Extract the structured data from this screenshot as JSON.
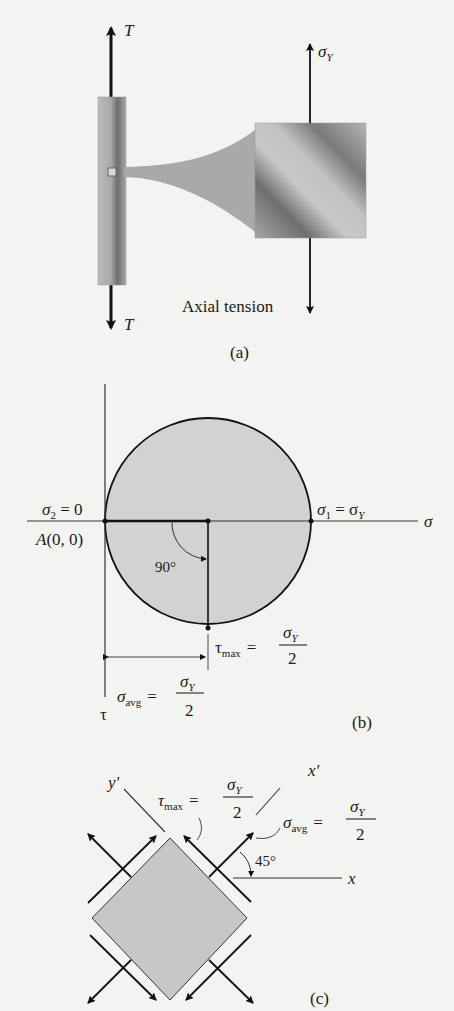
{
  "figure_a": {
    "force_top_label": "T",
    "force_bottom_label": "T",
    "stress_label": "σ",
    "stress_sub": "Y",
    "caption_text": "Axial tension",
    "panel_label": "(a)"
  },
  "figure_b": {
    "sigma2_label": "σ",
    "sigma2_sub": "2",
    "sigma2_value": " = 0",
    "origin_label": "A(0, 0)",
    "sigma1_label": "σ",
    "sigma1_sub": "1",
    "sigma1_eq": " = σ",
    "sigma1_eq_sub": "Y",
    "sigma_axis_label": "σ",
    "tau_axis_label": "τ",
    "angle_label": "90°",
    "tau_max_label": "τ",
    "tau_max_sub": "max",
    "tau_max_eq": "=",
    "frac_num": "σ",
    "frac_num_sub": "Y",
    "frac_den": "2",
    "sigma_avg_label": "σ",
    "sigma_avg_sub": "avg",
    "sigma_avg_eq": "=",
    "panel_label": "(b)"
  },
  "figure_c": {
    "y_prime_label": "y′",
    "x_prime_label": "x′",
    "x_axis_label": "x",
    "angle_label": "45°",
    "tau_max_label": "τ",
    "tau_max_sub": "max",
    "sigma_avg_label": "σ",
    "sigma_avg_sub": "avg",
    "eq": "=",
    "frac_num": "σ",
    "frac_num_sub": "Y",
    "frac_den": "2",
    "panel_label": "(c)"
  }
}
